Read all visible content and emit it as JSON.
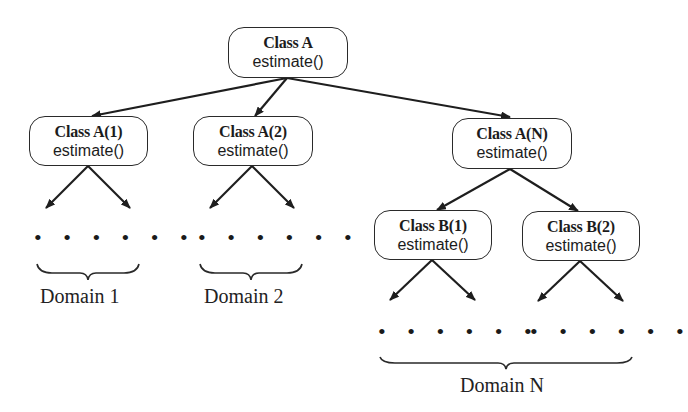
{
  "diagram": {
    "type": "class-hierarchy-tree",
    "nodes": {
      "root": {
        "title": "Class A",
        "method": "estimate()"
      },
      "a1": {
        "title": "Class A(1)",
        "method": "estimate()"
      },
      "a2": {
        "title": "Class A(2)",
        "method": "estimate()"
      },
      "an": {
        "title": "Class A(N)",
        "method": "estimate()"
      },
      "b1": {
        "title": "Class B(1)",
        "method": "estimate()"
      },
      "b2": {
        "title": "Class B(2)",
        "method": "estimate()"
      }
    },
    "edges": [
      [
        "root",
        "a1"
      ],
      [
        "root",
        "a2"
      ],
      [
        "root",
        "an"
      ],
      [
        "an",
        "b1"
      ],
      [
        "an",
        "b2"
      ]
    ],
    "ellipsis": "• • • • • •",
    "domains": {
      "d1": "Domain 1",
      "d2": "Domain 2",
      "dn": "Domain N"
    }
  }
}
